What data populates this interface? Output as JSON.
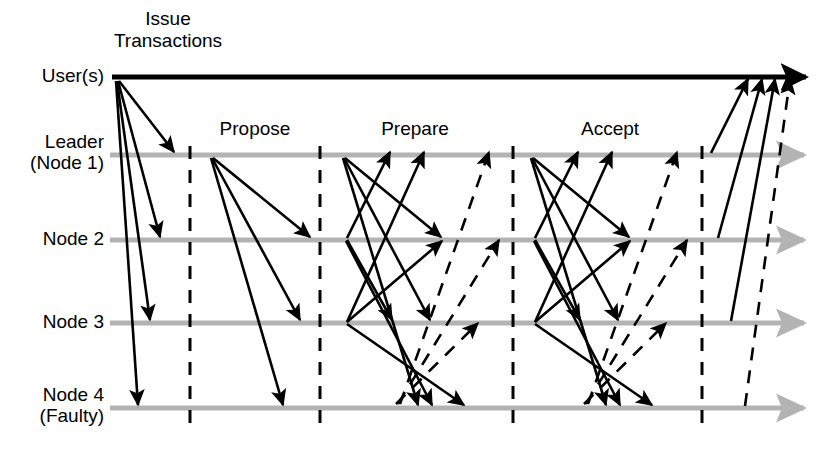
{
  "diagram": {
    "type": "sequence-diagram",
    "colors": {
      "timeline_user": "#000000",
      "timeline_node": "#b3b3b3",
      "message_solid": "#000000",
      "message_dashed": "#000000",
      "phase_divider": "#000000",
      "background": "#ffffff"
    },
    "lanes": [
      {
        "id": "user",
        "label": "User(s)",
        "label2": "",
        "y": 77
      },
      {
        "id": "leader",
        "label": "Leader",
        "label2": "(Node 1)",
        "y": 155
      },
      {
        "id": "node2",
        "label": "Node 2",
        "label2": "",
        "y": 240
      },
      {
        "id": "node3",
        "label": "Node 3",
        "label2": "",
        "y": 323
      },
      {
        "id": "node4",
        "label": "Node 4",
        "label2": "(Faulty)",
        "y": 408
      }
    ],
    "phases": [
      {
        "id": "issue",
        "label": "Issue\nTransactions",
        "label_x": 168,
        "label_y": 8,
        "two_line": true
      },
      {
        "id": "propose",
        "label": "Propose",
        "label_x": 255,
        "label_y": 118,
        "two_line": false
      },
      {
        "id": "prepare",
        "label": "Prepare",
        "label_x": 415,
        "label_y": 118,
        "two_line": false
      },
      {
        "id": "accept",
        "label": "Accept",
        "label_x": 610,
        "label_y": 118,
        "two_line": false
      }
    ],
    "dividers": [
      190,
      320,
      513,
      702
    ],
    "timeline_start_x": 110,
    "timeline_end_x": 820,
    "user_timeline_start_x": 112,
    "user_timeline_end_x": 820,
    "messages": [
      {
        "phase": "issue",
        "from": "user",
        "to": "leader",
        "style": "solid",
        "x1": 119,
        "y1": 81,
        "x2": 174,
        "y2": 152
      },
      {
        "phase": "issue",
        "from": "user",
        "to": "node2",
        "style": "solid",
        "x1": 118,
        "y1": 81,
        "x2": 160,
        "y2": 237
      },
      {
        "phase": "issue",
        "from": "user",
        "to": "node3",
        "style": "solid",
        "x1": 117,
        "y1": 81,
        "x2": 150,
        "y2": 320
      },
      {
        "phase": "issue",
        "from": "user",
        "to": "node4",
        "style": "solid",
        "x1": 116,
        "y1": 81,
        "x2": 138,
        "y2": 405
      },
      {
        "phase": "propose",
        "from": "leader",
        "to": "node2",
        "style": "solid",
        "x1": 213,
        "y1": 158,
        "x2": 310,
        "y2": 237
      },
      {
        "phase": "propose",
        "from": "leader",
        "to": "node3",
        "style": "solid",
        "x1": 212,
        "y1": 158,
        "x2": 300,
        "y2": 320
      },
      {
        "phase": "propose",
        "from": "leader",
        "to": "node4",
        "style": "solid",
        "x1": 211,
        "y1": 158,
        "x2": 283,
        "y2": 405
      },
      {
        "phase": "prepare",
        "from": "leader",
        "to": "node2",
        "style": "solid",
        "x1": 345,
        "y1": 158,
        "x2": 441,
        "y2": 237
      },
      {
        "phase": "prepare",
        "from": "leader",
        "to": "node3",
        "style": "solid",
        "x1": 344,
        "y1": 158,
        "x2": 430,
        "y2": 320
      },
      {
        "phase": "prepare",
        "from": "leader",
        "to": "node4",
        "style": "solid",
        "x1": 343,
        "y1": 158,
        "x2": 418,
        "y2": 405
      },
      {
        "phase": "prepare",
        "from": "node2",
        "to": "leader",
        "style": "solid",
        "x1": 347,
        "y1": 238,
        "x2": 390,
        "y2": 152
      },
      {
        "phase": "prepare",
        "from": "node2",
        "to": "node3",
        "style": "solid",
        "x1": 347,
        "y1": 240,
        "x2": 392,
        "y2": 320
      },
      {
        "phase": "prepare",
        "from": "node2",
        "to": "node4",
        "style": "solid",
        "x1": 346,
        "y1": 241,
        "x2": 432,
        "y2": 405
      },
      {
        "phase": "prepare",
        "from": "node3",
        "to": "leader",
        "style": "solid",
        "x1": 347,
        "y1": 322,
        "x2": 424,
        "y2": 152
      },
      {
        "phase": "prepare",
        "from": "node3",
        "to": "node2",
        "style": "solid",
        "x1": 347,
        "y1": 322,
        "x2": 442,
        "y2": 241
      },
      {
        "phase": "prepare",
        "from": "node3",
        "to": "node4",
        "style": "solid",
        "x1": 347,
        "y1": 324,
        "x2": 464,
        "y2": 405
      },
      {
        "phase": "prepare",
        "from": "node4",
        "to": "leader",
        "style": "dashed",
        "x1": 400,
        "y1": 404,
        "x2": 489,
        "y2": 152
      },
      {
        "phase": "prepare",
        "from": "node4",
        "to": "node2",
        "style": "dashed",
        "x1": 398,
        "y1": 404,
        "x2": 499,
        "y2": 240
      },
      {
        "phase": "prepare",
        "from": "node4",
        "to": "node3",
        "style": "dashed",
        "x1": 396,
        "y1": 404,
        "x2": 478,
        "y2": 323
      },
      {
        "phase": "accept",
        "from": "leader",
        "to": "node2",
        "style": "solid",
        "x1": 533,
        "y1": 158,
        "x2": 629,
        "y2": 237
      },
      {
        "phase": "accept",
        "from": "leader",
        "to": "node3",
        "style": "solid",
        "x1": 532,
        "y1": 158,
        "x2": 618,
        "y2": 320
      },
      {
        "phase": "accept",
        "from": "leader",
        "to": "node4",
        "style": "solid",
        "x1": 531,
        "y1": 158,
        "x2": 606,
        "y2": 405
      },
      {
        "phase": "accept",
        "from": "node2",
        "to": "leader",
        "style": "solid",
        "x1": 535,
        "y1": 238,
        "x2": 578,
        "y2": 152
      },
      {
        "phase": "accept",
        "from": "node2",
        "to": "node3",
        "style": "solid",
        "x1": 535,
        "y1": 240,
        "x2": 580,
        "y2": 320
      },
      {
        "phase": "accept",
        "from": "node2",
        "to": "node4",
        "style": "solid",
        "x1": 534,
        "y1": 241,
        "x2": 620,
        "y2": 405
      },
      {
        "phase": "accept",
        "from": "node3",
        "to": "leader",
        "style": "solid",
        "x1": 535,
        "y1": 322,
        "x2": 612,
        "y2": 152
      },
      {
        "phase": "accept",
        "from": "node3",
        "to": "node2",
        "style": "solid",
        "x1": 535,
        "y1": 322,
        "x2": 630,
        "y2": 241
      },
      {
        "phase": "accept",
        "from": "node3",
        "to": "node4",
        "style": "solid",
        "x1": 535,
        "y1": 324,
        "x2": 652,
        "y2": 405
      },
      {
        "phase": "accept",
        "from": "node4",
        "to": "leader",
        "style": "dashed",
        "x1": 588,
        "y1": 404,
        "x2": 677,
        "y2": 152
      },
      {
        "phase": "accept",
        "from": "node4",
        "to": "node2",
        "style": "dashed",
        "x1": 586,
        "y1": 404,
        "x2": 687,
        "y2": 240
      },
      {
        "phase": "accept",
        "from": "node4",
        "to": "node3",
        "style": "dashed",
        "x1": 584,
        "y1": 404,
        "x2": 666,
        "y2": 323
      },
      {
        "phase": "reply",
        "from": "leader",
        "to": "user",
        "style": "solid",
        "x1": 711,
        "y1": 153,
        "x2": 748,
        "y2": 79
      },
      {
        "phase": "reply",
        "from": "node2",
        "to": "user",
        "style": "solid",
        "x1": 718,
        "y1": 238,
        "x2": 762,
        "y2": 79
      },
      {
        "phase": "reply",
        "from": "node3",
        "to": "user",
        "style": "solid",
        "x1": 731,
        "y1": 321,
        "x2": 775,
        "y2": 79
      },
      {
        "phase": "reply",
        "from": "node4",
        "to": "user",
        "style": "dashed",
        "x1": 745,
        "y1": 406,
        "x2": 790,
        "y2": 79
      }
    ]
  }
}
